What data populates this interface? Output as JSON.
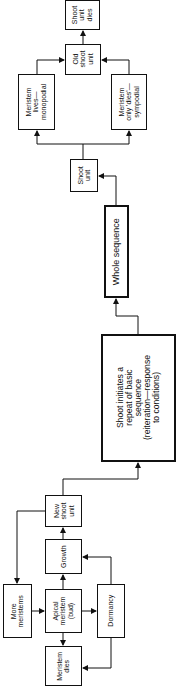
{
  "diagram": {
    "title": "",
    "orientation": "rotated-90",
    "nodes": [
      {
        "id": "shoot_unit_dies",
        "label": "Shoot\nunit\ndies",
        "x": 65,
        "y": 0,
        "w": 35,
        "h": 30,
        "fs": 7
      },
      {
        "id": "old_shoot_unit",
        "label": "Old\nshoot\nunit",
        "x": 65,
        "y": 44,
        "w": 36,
        "h": 31,
        "fs": 7
      },
      {
        "id": "meristem_lives",
        "label": "Meristem\nlives—\nmonopodial",
        "x": 18,
        "y": 74,
        "w": 37,
        "h": 56,
        "fs": 7
      },
      {
        "id": "meristem_dies_sympodial",
        "label": "Meristem\nonly 'dies'—\nsympodial",
        "x": 111,
        "y": 74,
        "w": 36,
        "h": 56,
        "fs": 7
      },
      {
        "id": "shoot_unit",
        "label": "Shoot\nunit",
        "x": 70,
        "y": 159,
        "w": 28,
        "h": 33,
        "fs": 7
      },
      {
        "id": "whole_sequence",
        "label": "Whole sequence",
        "x": 104,
        "y": 205,
        "w": 25,
        "h": 93,
        "fs": 9,
        "thick": true
      },
      {
        "id": "shoot_initiates",
        "label": "Shoot initiates a\nrepeat of basic\nsequence\n(reiteration—response\nto conditions)",
        "x": 101,
        "y": 334,
        "w": 75,
        "h": 128,
        "fs": 8.6,
        "thick": true
      },
      {
        "id": "new_shoot_unit",
        "label": "New\nshoot\nunit",
        "x": 45,
        "y": 495,
        "w": 37,
        "h": 32,
        "fs": 7
      },
      {
        "id": "growth",
        "label": "Growth",
        "x": 45,
        "y": 539,
        "w": 37,
        "h": 35,
        "fs": 7
      },
      {
        "id": "more_meristems",
        "label": "More\nmeristems",
        "x": 3,
        "y": 584,
        "w": 29,
        "h": 54,
        "fs": 7
      },
      {
        "id": "apical_meristem",
        "label": "Apical\nmeristem\n(bud)",
        "x": 45,
        "y": 589,
        "w": 37,
        "h": 44,
        "fs": 7
      },
      {
        "id": "dormancy",
        "label": "Dormancy",
        "x": 97,
        "y": 584,
        "w": 28,
        "h": 54,
        "fs": 7
      },
      {
        "id": "meristem_dies",
        "label": "Meristem\ndies",
        "x": 45,
        "y": 646,
        "w": 37,
        "h": 40,
        "fs": 7
      }
    ],
    "edges": [
      {
        "from": "apical_meristem",
        "to": "growth"
      },
      {
        "from": "apical_meristem",
        "to": "meristem_dies"
      },
      {
        "from": "apical_meristem",
        "to": "dormancy"
      },
      {
        "from": "dormancy",
        "to": "growth"
      },
      {
        "from": "dormancy",
        "to": "meristem_dies"
      },
      {
        "from": "more_meristems",
        "to": "apical_meristem"
      },
      {
        "from": "growth",
        "to": "new_shoot_unit"
      },
      {
        "from": "new_shoot_unit",
        "to": "more_meristems"
      },
      {
        "from": "new_shoot_unit",
        "to": "shoot_initiates"
      },
      {
        "from": "shoot_initiates",
        "to": "whole_sequence"
      },
      {
        "from": "whole_sequence",
        "to": "shoot_unit"
      },
      {
        "from": "shoot_unit",
        "to": "meristem_lives"
      },
      {
        "from": "shoot_unit",
        "to": "meristem_dies_sympodial"
      },
      {
        "from": "meristem_lives",
        "to": "old_shoot_unit"
      },
      {
        "from": "meristem_dies_sympodial",
        "to": "old_shoot_unit"
      },
      {
        "from": "old_shoot_unit",
        "to": "shoot_unit_dies"
      }
    ],
    "line_color": "#111111"
  }
}
